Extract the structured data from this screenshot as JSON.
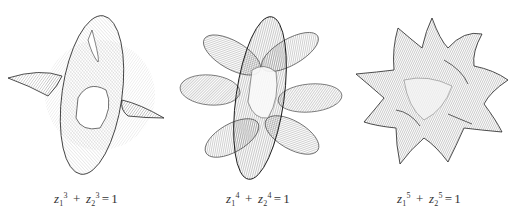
{
  "figure": {
    "panels": [
      {
        "name": "fermat-surface-degree-3",
        "caption": {
          "var": "z",
          "idx1": "1",
          "idx2": "2",
          "exp": "3",
          "plus": "+",
          "eq": "=",
          "rhs": "1"
        },
        "petals": 4
      },
      {
        "name": "fermat-surface-degree-4",
        "caption": {
          "var": "z",
          "idx1": "1",
          "idx2": "2",
          "exp": "4",
          "plus": "+",
          "eq": "=",
          "rhs": "1"
        },
        "petals": 6
      },
      {
        "name": "fermat-surface-degree-5",
        "caption": {
          "var": "z",
          "idx1": "1",
          "idx2": "2",
          "exp": "5",
          "plus": "+",
          "eq": "=",
          "rhs": "1"
        },
        "petals": 10
      }
    ],
    "colors": {
      "line": "#1a1a1a",
      "background": "#ffffff",
      "caption": "#333333"
    }
  }
}
